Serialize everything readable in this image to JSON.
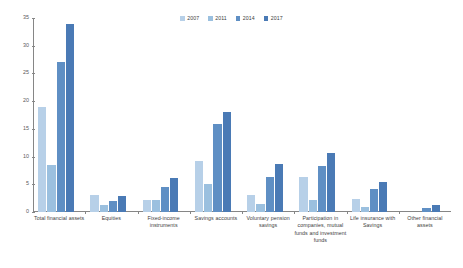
{
  "chart_data": {
    "type": "bar",
    "title": "",
    "subtitle": "",
    "xlabel": "",
    "ylabel": "",
    "ylim": [
      0,
      35
    ],
    "yticks": [
      0,
      5,
      10,
      15,
      20,
      25,
      30,
      35
    ],
    "ytick_labels": [
      "0",
      "5",
      "10",
      "15",
      "20",
      "25",
      "30",
      "35"
    ],
    "grid": false,
    "legend_position": "top-center",
    "categories": [
      "Total financial assets",
      "Equities",
      "Fixed-income instruments",
      "Savings accounts",
      "Voluntary pension savings",
      "Participation in companies, mutual funds and investment funds",
      "Life insurance with Savings",
      "Other financial assets"
    ],
    "series": [
      {
        "name": "2007",
        "color": "#b7d0e8",
        "values": [
          19.0,
          3.0,
          2.2,
          9.2,
          3.1,
          6.4,
          2.3,
          0.0
        ]
      },
      {
        "name": "2011",
        "color": "#9bc0df",
        "values": [
          8.5,
          1.2,
          2.1,
          5.1,
          1.5,
          2.2,
          0.9,
          0.0
        ]
      },
      {
        "name": "2014",
        "color": "#5f8fc4",
        "values": [
          27.1,
          2.0,
          4.6,
          15.8,
          6.3,
          8.3,
          4.1,
          0.8
        ]
      },
      {
        "name": "2017",
        "color": "#4a7ab5",
        "values": [
          34.0,
          2.9,
          6.1,
          18.1,
          8.6,
          10.7,
          5.4,
          1.3
        ]
      }
    ]
  },
  "legend": {
    "items": [
      {
        "label": "2007"
      },
      {
        "label": "2011"
      },
      {
        "label": "2014"
      },
      {
        "label": "2017"
      }
    ]
  },
  "axis": {
    "y_labels": [
      "35",
      "30",
      "25",
      "20",
      "15",
      "10",
      "5",
      "0"
    ]
  }
}
